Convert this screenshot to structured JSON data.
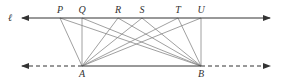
{
  "diagram": {
    "type": "geometry-parallel-lines",
    "line_label": "ℓ",
    "top_line": {
      "y": 18,
      "x1": 22,
      "x2": 270,
      "style": "solid",
      "arrows": "both"
    },
    "bottom_line": {
      "y": 66,
      "x1": 22,
      "x2": 270,
      "style": "dashed-ends",
      "arrows": "both",
      "solid_from": 82,
      "solid_to": 201
    },
    "top_points": [
      {
        "label": "P",
        "x": 60
      },
      {
        "label": "Q",
        "x": 82
      },
      {
        "label": "R",
        "x": 118
      },
      {
        "label": "S",
        "x": 142
      },
      {
        "label": "T",
        "x": 178
      },
      {
        "label": "U",
        "x": 201
      }
    ],
    "bottom_points": [
      {
        "label": "A",
        "x": 82
      },
      {
        "label": "B",
        "x": 201
      }
    ],
    "segments_note": "Each of A and B is joined to each of P, Q, R, S, T, U",
    "colors": {
      "line": "#333333",
      "segment": "#888888"
    }
  }
}
